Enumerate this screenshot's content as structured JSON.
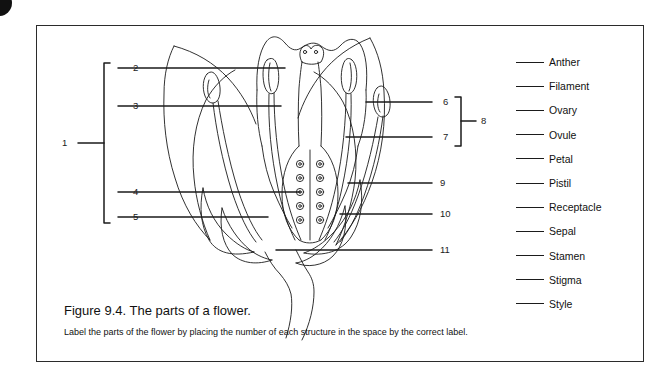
{
  "figure": {
    "caption_title": "Figure 9.4. The parts of a flower.",
    "caption_instruction": "Label the parts of the flower by placing the number of each structure in the space by the correct label."
  },
  "callouts": {
    "left_group_label": "1",
    "left_items": [
      "2",
      "3",
      "4",
      "5"
    ],
    "right_bracket_label": "8",
    "right_bracket_items": [
      "6",
      "7"
    ],
    "right_items": [
      "9",
      "10",
      "11"
    ]
  },
  "numbers": {
    "n1": "1",
    "n2": "2",
    "n3": "3",
    "n4": "4",
    "n5": "5",
    "n6": "6",
    "n7": "7",
    "n8": "8",
    "n9": "9",
    "n10": "10",
    "n11": "11"
  },
  "answer_list": [
    {
      "label": "Anther"
    },
    {
      "label": "Filament"
    },
    {
      "label": "Ovary"
    },
    {
      "label": "Ovule"
    },
    {
      "label": "Petal"
    },
    {
      "label": "Pistil"
    },
    {
      "label": "Receptacle"
    },
    {
      "label": "Sepal"
    },
    {
      "label": "Stamen"
    },
    {
      "label": "Stigma"
    },
    {
      "label": "Style"
    }
  ],
  "colors": {
    "ink": "#1b1b1b",
    "border": "#2b2b2b",
    "background": "#ffffff"
  }
}
